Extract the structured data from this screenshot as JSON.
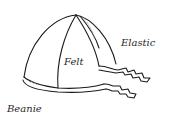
{
  "diagram": {
    "labels": {
      "material": "Felt",
      "trim": "Elastic",
      "name": "Beanie"
    },
    "colors": {
      "ink": "#1a1a1a",
      "background": "#ffffff",
      "hatch": "#9a9a9a"
    }
  }
}
